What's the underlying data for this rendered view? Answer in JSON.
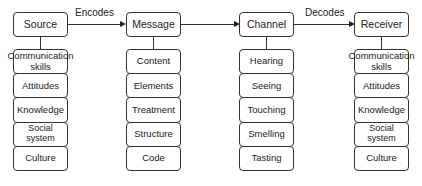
{
  "diagram": {
    "nodes": [
      {
        "label": "Source",
        "items": [
          "Communication skills",
          "Attitudes",
          "Knowledge",
          "Social system",
          "Culture"
        ]
      },
      {
        "label": "Message",
        "items": [
          "Content",
          "Elements",
          "Treatment",
          "Structure",
          "Code"
        ]
      },
      {
        "label": "Channel",
        "items": [
          "Hearing",
          "Seeing",
          "Touching",
          "Smelling",
          "Tasting"
        ]
      },
      {
        "label": "Receiver",
        "items": [
          "Communication skills",
          "Attitudes",
          "Knowledge",
          "Social system",
          "Culture"
        ]
      }
    ],
    "edges": [
      {
        "from": "Source",
        "to": "Message",
        "label": "Encodes"
      },
      {
        "from": "Message",
        "to": "Channel",
        "label": ""
      },
      {
        "from": "Channel",
        "to": "Receiver",
        "label": "Decodes"
      }
    ]
  }
}
